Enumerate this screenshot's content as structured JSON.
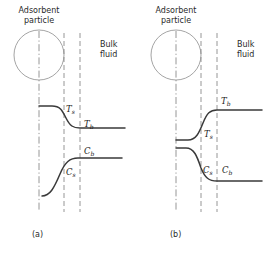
{
  "figure": {
    "panels": [
      {
        "id": "a",
        "label": "(a)",
        "region_labels": {
          "particle": "Adsorbent\nparticle",
          "fluid": "Bulk\nfluid"
        },
        "curves": [
          {
            "name": "temperature-profile",
            "quantity": "T",
            "shape": "decreasing-sigmoid",
            "surface_label": "T",
            "surface_sub": "s",
            "bulk_label": "T",
            "bulk_sub": "b",
            "description": "Temperature falls from a high value at the particle surface to a lower bulk value across the film"
          },
          {
            "name": "concentration-profile",
            "quantity": "C",
            "shape": "increasing-sigmoid",
            "surface_label": "C",
            "surface_sub": "s",
            "bulk_label": "C",
            "bulk_sub": "b",
            "description": "Concentration rises from a low value at the particle surface to a higher bulk value across the film"
          }
        ]
      },
      {
        "id": "b",
        "label": "(b)",
        "region_labels": {
          "particle": "Adsorbent\nparticle",
          "fluid": "Bulk\nfluid"
        },
        "curves": [
          {
            "name": "temperature-profile",
            "quantity": "T",
            "shape": "increasing-sigmoid",
            "surface_label": "T",
            "surface_sub": "s",
            "bulk_label": "T",
            "bulk_sub": "b",
            "description": "Temperature rises from a low value at the particle surface to a higher bulk value across the film"
          },
          {
            "name": "concentration-profile",
            "quantity": "C",
            "shape": "decreasing-sigmoid",
            "surface_label": "C",
            "surface_sub": "s",
            "bulk_label": "C",
            "bulk_sub": "b",
            "description": "Concentration falls from a high value at the particle surface to a lower bulk value across the film"
          }
        ]
      }
    ],
    "colors": {
      "curve": "#3a3a3a",
      "guide_line": "#8a8a8a",
      "center_line": "#8a8a8a",
      "circle_outline": "#9a9a9a",
      "text": "#2a2a2a",
      "background": "#ffffff"
    }
  }
}
